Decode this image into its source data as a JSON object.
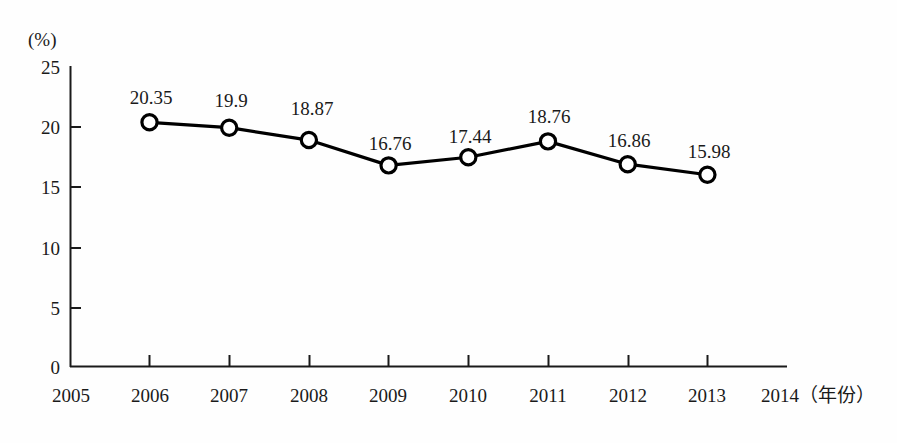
{
  "chart_data": {
    "type": "line",
    "title": "",
    "subtitle": "",
    "xlabel": "年份",
    "ylabel": "(%)",
    "unit_label": "(%)",
    "x_axis_title": "（年份）",
    "x_axis_title_full": "2014（年份）",
    "categories": [
      "2005",
      "2006",
      "2007",
      "2008",
      "2009",
      "2010",
      "2011",
      "2012",
      "2013",
      "2014"
    ],
    "x_tick_labels": [
      "2005",
      "2006",
      "2007",
      "2008",
      "2009",
      "2010",
      "2011",
      "2012",
      "2013"
    ],
    "y_tick_labels": [
      "25",
      "20",
      "15",
      "10",
      "5",
      "0"
    ],
    "y_ticks": [
      25,
      20,
      15,
      10,
      5,
      0
    ],
    "ylim": [
      0,
      25
    ],
    "xlim": [
      "2005",
      "2014"
    ],
    "grid": false,
    "legend": null,
    "series": [
      {
        "name": "",
        "x": [
          "2006",
          "2007",
          "2008",
          "2009",
          "2010",
          "2011",
          "2012",
          "2013"
        ],
        "values": [
          20.35,
          19.9,
          18.87,
          16.76,
          17.44,
          18.76,
          16.86,
          15.98
        ],
        "labels": [
          "20.35",
          "19.9",
          "18.87",
          "16.76",
          "17.44",
          "18.76",
          "16.86",
          "15.98"
        ],
        "marker": "open-circle",
        "line_color": "#000000",
        "marker_fill": "#ffffff"
      }
    ]
  },
  "colors": {
    "background": "#fefefe",
    "axis": "#1a1a1a",
    "line": "#000000",
    "marker_fill": "#ffffff",
    "text": "#1a1a1a"
  }
}
